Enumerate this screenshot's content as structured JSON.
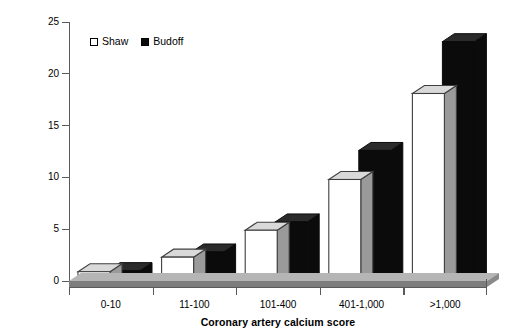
{
  "chart_data": {
    "type": "bar",
    "title": "",
    "xlabel": "Coronary artery calcium score",
    "ylabel": "All-Cause mortality rate (%)",
    "categories": [
      "0-10",
      "11-100",
      "101-400",
      "401-1,000",
      ">1,000"
    ],
    "series": [
      {
        "name": "Shaw",
        "values": [
          0.9,
          2.3,
          4.9,
          9.8,
          18.1
        ],
        "color": "#ffffff"
      },
      {
        "name": "Budoff",
        "values": [
          1.0,
          2.8,
          5.7,
          12.6,
          23.1
        ],
        "color": "#0b0b0b"
      }
    ],
    "ylim": [
      0,
      25
    ],
    "yticks": [
      0,
      5,
      10,
      15,
      20,
      25
    ],
    "ytick_labels": [
      "0",
      "5",
      "10",
      "15",
      "20",
      "25"
    ],
    "grid": false,
    "legend_position": "top-left",
    "style": "3d-bars"
  },
  "axes": {
    "y_title": "All-Cause mortality rate (%)",
    "x_title": "Coronary artery calcium score",
    "y_tick_labels": [
      "25",
      "20",
      "15",
      "10",
      "5",
      "0"
    ],
    "x_tick_labels": [
      "0-10",
      "11-100",
      "101-400",
      "401-1,000",
      ">1,000"
    ]
  },
  "legend": {
    "entries": [
      {
        "label": "Shaw",
        "swatch": "hollow-square-icon"
      },
      {
        "label": "Budoff",
        "swatch": "filled-square-icon"
      }
    ]
  },
  "colors": {
    "axis": "#5a5a5a",
    "bar_shaw_fill": "#ffffff",
    "bar_shaw_edge": "#3f3f3f",
    "bar_budoff_fill": "#0b0b0b",
    "bar_top_face": "#d9d9d9",
    "bar_side_face": "#9a9a9a",
    "base_platform": "#7d7d7d",
    "base_platform_top": "#b5b5b5",
    "text": "#000000"
  }
}
